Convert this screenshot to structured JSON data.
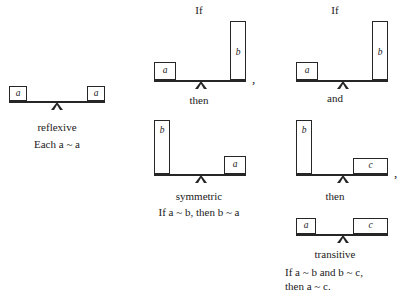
{
  "figure": {
    "ink_color": "#262626",
    "background_color": "#ffffff"
  },
  "columns": [
    {
      "id": "reflexive",
      "name_label": "reflexive",
      "statement": "Each a ~ a",
      "scales": [
        {
          "id": "reflexive-scale",
          "tilt": "level",
          "left_box": {
            "label": "a",
            "size": "short"
          },
          "right_box": {
            "label": "a",
            "size": "short"
          }
        }
      ],
      "connectors": []
    },
    {
      "id": "symmetric",
      "name_label": "symmetric",
      "statement": "If a ~ b, then b ~ a",
      "connectors": [
        {
          "id": "symmetric-if",
          "text": "If"
        },
        {
          "id": "symmetric-then",
          "text": "then"
        }
      ],
      "scales": [
        {
          "id": "symmetric-premise",
          "tilt": "level",
          "left_box": {
            "label": "a",
            "size": "short"
          },
          "right_box": {
            "label": "b",
            "size": "tall"
          },
          "trailing_punctuation": ","
        },
        {
          "id": "symmetric-conclusion",
          "tilt": "level",
          "left_box": {
            "label": "b",
            "size": "tall"
          },
          "right_box": {
            "label": "a",
            "size": "short"
          }
        }
      ]
    },
    {
      "id": "transitive",
      "name_label": "transitive",
      "statement_line_1": "If a ~ b and b ~ c,",
      "statement_line_2": "then a ~ c.",
      "connectors": [
        {
          "id": "transitive-if",
          "text": "If"
        },
        {
          "id": "transitive-and",
          "text": "and"
        },
        {
          "id": "transitive-then",
          "text": "then"
        }
      ],
      "scales": [
        {
          "id": "transitive-premise-1",
          "tilt": "level",
          "left_box": {
            "label": "a",
            "size": "short"
          },
          "right_box": {
            "label": "b",
            "size": "tall"
          }
        },
        {
          "id": "transitive-premise-2",
          "tilt": "level",
          "left_box": {
            "label": "b",
            "size": "tall"
          },
          "right_box": {
            "label": "c",
            "size": "wide"
          },
          "trailing_punctuation": ","
        },
        {
          "id": "transitive-conclusion",
          "tilt": "level",
          "left_box": {
            "label": "a",
            "size": "short"
          },
          "right_box": {
            "label": "c",
            "size": "wide"
          }
        }
      ]
    }
  ]
}
